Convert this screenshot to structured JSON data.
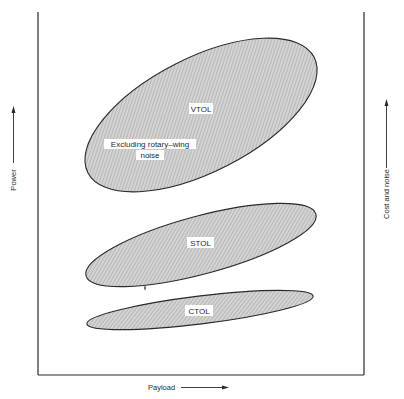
{
  "diagram": {
    "x_axis_label": "Payload",
    "y_axis_left_label": "Power",
    "y_axis_right_label": "Cost and noise",
    "regions": [
      {
        "id": "vtol",
        "label": "VTOL",
        "note_line1": "Excluding rotary–wing",
        "note_line2": "noise"
      },
      {
        "id": "stol",
        "label": "STOL"
      },
      {
        "id": "ctol",
        "label": "CTOL"
      }
    ],
    "colors": {
      "line": "#2a2a2a",
      "fill": "#c8c8c8",
      "background": "#ffffff"
    }
  }
}
